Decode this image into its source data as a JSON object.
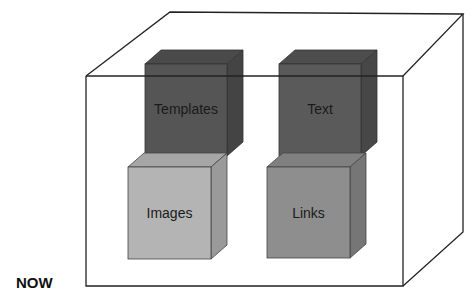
{
  "diagram": {
    "caption": "NOW",
    "container": {
      "shape": "3d-box",
      "stroke": "#222222",
      "fill": "#ffffff"
    },
    "cubes": [
      {
        "label": "Templates",
        "front": "#555555",
        "top": "#4a4a4a",
        "side": "#444444"
      },
      {
        "label": "Text",
        "front": "#5a5a5a",
        "top": "#4d4d4d",
        "side": "#474747"
      },
      {
        "label": "Images",
        "front": "#b4b4b4",
        "top": "#a6a6a6",
        "side": "#9a9a9a"
      },
      {
        "label": "Links",
        "front": "#8e8e8e",
        "top": "#808080",
        "side": "#767676"
      }
    ]
  }
}
